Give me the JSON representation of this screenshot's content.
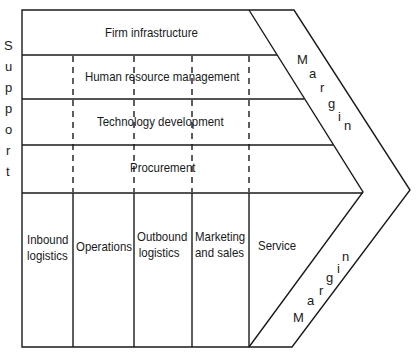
{
  "diagram": {
    "side_label": [
      "S",
      "u",
      "p",
      "p",
      "o",
      "r",
      "t"
    ],
    "support_activities": [
      {
        "label": "Firm infrastructure"
      },
      {
        "label": "Human resource management"
      },
      {
        "label": "Technology development"
      },
      {
        "label": "Procurement"
      }
    ],
    "primary_activities": [
      {
        "line1": "Inbound",
        "line2": "logistics"
      },
      {
        "line1": "Operations",
        "line2": ""
      },
      {
        "line1": "Outbound",
        "line2": "logistics"
      },
      {
        "line1": "Marketing",
        "line2": "and sales"
      },
      {
        "line1": "Service",
        "line2": ""
      }
    ],
    "margin_top": [
      "M",
      "a",
      "r",
      "g",
      "i",
      "n"
    ],
    "margin_bottom": [
      "M",
      "a",
      "r",
      "g",
      "i",
      "n"
    ],
    "line_color": "#1a1a1a"
  }
}
